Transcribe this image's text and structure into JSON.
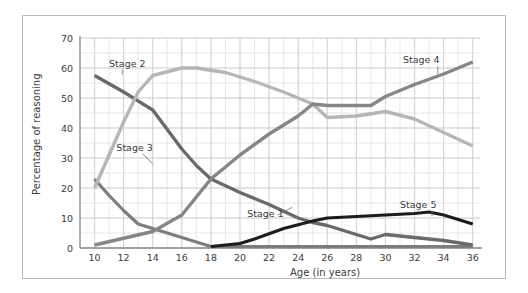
{
  "figure": {
    "background_color": "#ffffff",
    "frame_color": "#b9b9b9"
  },
  "chart_data": {
    "type": "line",
    "title": "",
    "xlabel": "Age (in years)",
    "ylabel": "Percentage of reasoning",
    "xlim": [
      9,
      36.5
    ],
    "ylim": [
      0,
      70
    ],
    "xticks": [
      10,
      12,
      14,
      16,
      18,
      20,
      22,
      24,
      26,
      28,
      30,
      32,
      34,
      36
    ],
    "yticks": [
      0,
      10,
      20,
      30,
      40,
      50,
      60,
      70
    ],
    "grid": true,
    "grid_minor_y_step": 5,
    "grid_minor_x_step": 1,
    "legend_position": "inline-labels",
    "series": [
      {
        "name": "Stage 1",
        "color": "#7d7d7d",
        "width": 3.2,
        "label_x": 20.5,
        "label_y": 11.5,
        "leader": [
          [
            22.6,
            11.0
          ],
          [
            23.6,
            13.6
          ]
        ],
        "x": [
          10,
          11,
          12,
          13,
          14,
          15,
          16,
          17,
          18,
          36
        ],
        "y": [
          23.0,
          17.5,
          12.5,
          8.0,
          6.5,
          5.0,
          3.5,
          2.0,
          0.5,
          0.5
        ]
      },
      {
        "name": "Stage 2",
        "color": "#6a6a6a",
        "width": 3.4,
        "label_x": 11.0,
        "label_y": 61.5,
        "leader": [
          [
            11.9,
            59.5
          ],
          [
            11.9,
            57.8
          ]
        ],
        "x": [
          10,
          12,
          14,
          16,
          17,
          18,
          20,
          22,
          24,
          25,
          26,
          27,
          29,
          30,
          32,
          34,
          36
        ],
        "y": [
          57.5,
          52.0,
          46.0,
          33.0,
          27.5,
          23.0,
          18.5,
          14.5,
          10.0,
          8.5,
          7.5,
          6.0,
          3.0,
          4.5,
          3.5,
          2.5,
          1.0
        ]
      },
      {
        "name": "Stage 3",
        "color": "#b6b6b6",
        "width": 3.4,
        "label_x": 11.5,
        "label_y": 33.5,
        "leader": [
          [
            13.3,
            31.5
          ],
          [
            14.0,
            28.0
          ]
        ],
        "x": [
          10,
          11,
          12,
          13,
          14,
          16,
          17,
          19,
          21,
          23,
          25,
          26,
          28,
          30,
          32,
          34,
          36
        ],
        "y": [
          20.0,
          31.0,
          42.0,
          52.0,
          57.5,
          60.0,
          60.0,
          58.5,
          55.5,
          52.0,
          48.0,
          43.5,
          44.0,
          45.5,
          43.0,
          38.5,
          34.0
        ]
      },
      {
        "name": "Stage 4",
        "color": "#868686",
        "width": 3.4,
        "label_x": 31.2,
        "label_y": 63.0,
        "leader": [
          [
            33.6,
            60.5
          ],
          [
            33.6,
            58.0
          ]
        ],
        "x": [
          10,
          14,
          16,
          18,
          20,
          22,
          24,
          25,
          26,
          28,
          29,
          30,
          32,
          34,
          36
        ],
        "y": [
          1.0,
          5.5,
          11.0,
          23.0,
          31.0,
          38.0,
          44.0,
          48.0,
          47.5,
          47.5,
          47.5,
          50.5,
          54.5,
          58.0,
          62.0
        ]
      },
      {
        "name": "Stage 5",
        "color": "#1c1c1c",
        "width": 3.0,
        "label_x": 31.0,
        "label_y": 14.5,
        "leader": [
          [
            33.2,
            12.5
          ],
          [
            33.2,
            10.5
          ]
        ],
        "x": [
          18,
          20,
          21,
          23,
          25,
          26,
          28,
          30,
          32,
          33,
          34,
          36
        ],
        "y": [
          0.5,
          1.5,
          3.0,
          6.5,
          9.0,
          10.0,
          10.5,
          11.0,
          11.5,
          12.0,
          11.0,
          8.0
        ]
      }
    ]
  },
  "axes": {
    "x_title": "Age (in years)",
    "y_title": "Percentage of reasoning",
    "x_tick_labels": [
      "10",
      "12",
      "14",
      "16",
      "18",
      "20",
      "22",
      "24",
      "26",
      "28",
      "30",
      "32",
      "34",
      "36"
    ],
    "y_tick_labels": [
      "0",
      "10",
      "20",
      "30",
      "40",
      "50",
      "60",
      "70"
    ]
  },
  "series_labels": {
    "stage1": "Stage 1",
    "stage2": "Stage 2",
    "stage3": "Stage 3",
    "stage4": "Stage 4",
    "stage5": "Stage 5"
  }
}
